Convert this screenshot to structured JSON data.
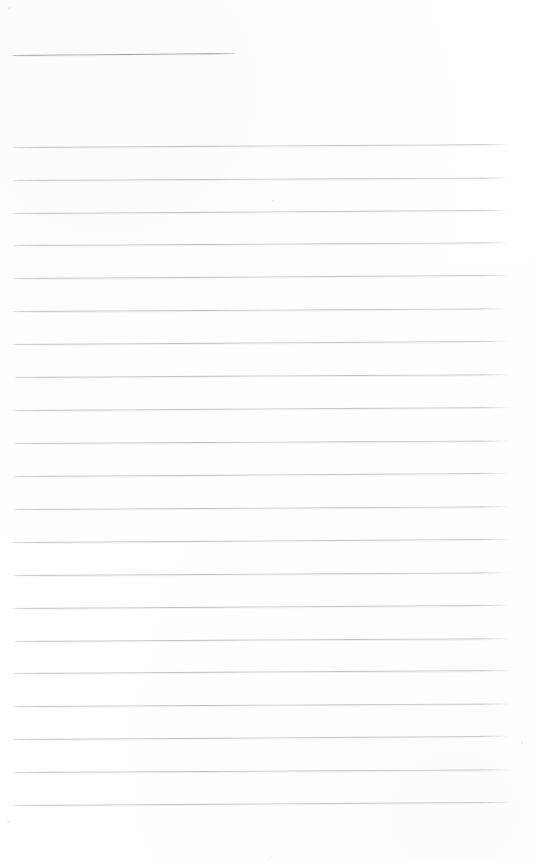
{
  "document": {
    "type": "scanned-ruled-paper",
    "title_text": "",
    "body_text": "",
    "page_width": 535,
    "page_height": 862,
    "background_color": "#ffffff",
    "rule_color": "#a8aab1",
    "is_blank": true,
    "visible_text_items": []
  },
  "header_rule": {
    "name": "title-blank-rule",
    "x_start": 11,
    "x_end": 237,
    "y": 55,
    "slant_deg": -0.5,
    "length": 226
  },
  "ruled_lines": {
    "count": 21,
    "x_start": 11,
    "x_end": 510,
    "first_y": 147,
    "spacing": 32.9,
    "slant_deg": -0.35,
    "items": [
      {
        "index": 1,
        "y": 147,
        "x_start": 11,
        "x_end": 510,
        "slant_deg": -0.34
      },
      {
        "index": 2,
        "y": 180,
        "x_start": 12,
        "x_end": 511,
        "slant_deg": -0.3
      },
      {
        "index": 3,
        "y": 213,
        "x_start": 11,
        "x_end": 509,
        "slant_deg": -0.38
      },
      {
        "index": 4,
        "y": 245,
        "x_start": 12,
        "x_end": 510,
        "slant_deg": -0.32
      },
      {
        "index": 5,
        "y": 278,
        "x_start": 11,
        "x_end": 511,
        "slant_deg": -0.36
      },
      {
        "index": 6,
        "y": 311,
        "x_start": 12,
        "x_end": 510,
        "slant_deg": -0.31
      },
      {
        "index": 7,
        "y": 344,
        "x_start": 11,
        "x_end": 509,
        "slant_deg": -0.37
      },
      {
        "index": 8,
        "y": 377,
        "x_start": 12,
        "x_end": 510,
        "slant_deg": -0.33
      },
      {
        "index": 9,
        "y": 410,
        "x_start": 11,
        "x_end": 511,
        "slant_deg": -0.35
      },
      {
        "index": 10,
        "y": 443,
        "x_start": 12,
        "x_end": 510,
        "slant_deg": -0.3
      },
      {
        "index": 11,
        "y": 476,
        "x_start": 11,
        "x_end": 509,
        "slant_deg": -0.38
      },
      {
        "index": 12,
        "y": 509,
        "x_start": 12,
        "x_end": 510,
        "slant_deg": -0.32
      },
      {
        "index": 13,
        "y": 542,
        "x_start": 11,
        "x_end": 511,
        "slant_deg": -0.36
      },
      {
        "index": 14,
        "y": 575,
        "x_start": 12,
        "x_end": 510,
        "slant_deg": -0.31
      },
      {
        "index": 15,
        "y": 608,
        "x_start": 11,
        "x_end": 509,
        "slant_deg": -0.37
      },
      {
        "index": 16,
        "y": 641,
        "x_start": 12,
        "x_end": 510,
        "slant_deg": -0.33
      },
      {
        "index": 17,
        "y": 673,
        "x_start": 11,
        "x_end": 511,
        "slant_deg": -0.35
      },
      {
        "index": 18,
        "y": 706,
        "x_start": 12,
        "x_end": 510,
        "slant_deg": -0.3
      },
      {
        "index": 19,
        "y": 739,
        "x_start": 11,
        "x_end": 509,
        "slant_deg": -0.38
      },
      {
        "index": 20,
        "y": 772,
        "x_start": 12,
        "x_end": 510,
        "slant_deg": -0.32
      },
      {
        "index": 21,
        "y": 805,
        "x_start": 11,
        "x_end": 511,
        "slant_deg": -0.36
      }
    ]
  },
  "specks": [
    {
      "x": 8,
      "y": 7,
      "size": 3
    },
    {
      "x": 272,
      "y": 200,
      "size": 2
    },
    {
      "x": 7,
      "y": 820,
      "size": 3
    },
    {
      "x": 521,
      "y": 742,
      "size": 2
    },
    {
      "x": 270,
      "y": 856,
      "size": 2
    }
  ]
}
